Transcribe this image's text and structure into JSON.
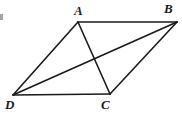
{
  "figure": {
    "kind": "geometry-diagram",
    "shape": "parallelogram",
    "background_color": "#ffffff",
    "stroke_color": "#1a1a1a",
    "label_color": "#1a1a1a",
    "stroke_width": 1.6,
    "canvas": {
      "width": 182,
      "height": 115
    },
    "vertices": [
      {
        "id": "A",
        "label": "A",
        "x": 78,
        "y": 22
      },
      {
        "id": "B",
        "label": "B",
        "x": 177,
        "y": 22
      },
      {
        "id": "C",
        "label": "C",
        "x": 110,
        "y": 94
      },
      {
        "id": "D",
        "label": "D",
        "x": 13,
        "y": 95
      }
    ],
    "edges": [
      {
        "id": "AB",
        "from": "A",
        "to": "B",
        "role": "side"
      },
      {
        "id": "BC",
        "from": "B",
        "to": "C",
        "role": "side"
      },
      {
        "id": "CD",
        "from": "C",
        "to": "D",
        "role": "side"
      },
      {
        "id": "DA",
        "from": "D",
        "to": "A",
        "role": "side"
      }
    ],
    "diagonals": [
      {
        "id": "AC",
        "from": "A",
        "to": "C",
        "role": "diagonal"
      },
      {
        "id": "DB",
        "from": "D",
        "to": "B",
        "role": "diagonal"
      }
    ],
    "intersection": {
      "id": "diagonal-intersection",
      "x": 94,
      "y": 63
    },
    "artifact": {
      "id": "left-edge-artifact",
      "x": 0,
      "y": 14,
      "width": 3,
      "height": 6
    }
  }
}
